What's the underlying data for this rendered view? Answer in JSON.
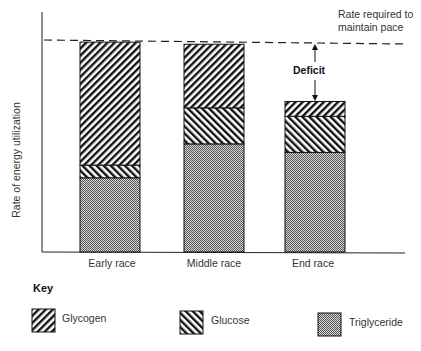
{
  "chart_data": {
    "type": "bar",
    "stacked": true,
    "title": "",
    "xlabel": "",
    "ylabel": "Rate of energy utilization",
    "ylim": [
      0,
      100
    ],
    "y_ticks": "none",
    "grid": false,
    "categories": [
      "Early race",
      "Middle race",
      "End race"
    ],
    "series": [
      {
        "name": "Triglyceride",
        "pattern": "crosshatch-stipple",
        "values": [
          35,
          51,
          47
        ]
      },
      {
        "name": "Glucose",
        "pattern": "diagonal-backslash",
        "values": [
          6,
          17,
          17
        ]
      },
      {
        "name": "Glycogen",
        "pattern": "diagonal-slash",
        "values": [
          58,
          30,
          7
        ]
      }
    ],
    "totals": [
      99,
      98,
      71
    ],
    "reference_line": {
      "value": 100,
      "style": "dashed",
      "label": "Rate required to maintain pace"
    },
    "annotations": [
      {
        "text": "Deficit",
        "category": "End race",
        "from": 71,
        "to": 100,
        "style": "double-arrow"
      }
    ],
    "legend": {
      "title": "Key",
      "position": "bottom",
      "entries": [
        "Glycogen",
        "Glucose",
        "Triglyceride"
      ]
    }
  },
  "labels": {
    "ylabel": "Rate of energy utilization",
    "required_line_1": "Rate required to",
    "required_line_2": "maintain pace",
    "deficit": "Deficit",
    "x": [
      "Early race",
      "Middle race",
      "End race"
    ],
    "key_title": "Key",
    "key": [
      "Glycogen",
      "Glucose",
      "Triglyceride"
    ]
  },
  "colors": {
    "ink": "#111111",
    "stipple": "#8a8a8a",
    "background": "#ffffff"
  }
}
